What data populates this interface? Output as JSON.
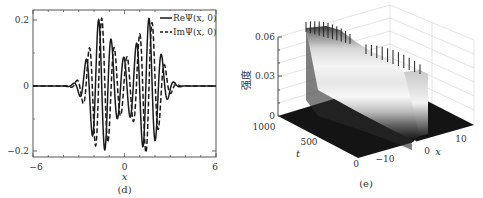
{
  "chart_data": [
    {
      "id": "d",
      "type": "line",
      "caption": "(d)",
      "xlabel": "x",
      "ylabel": "",
      "xlim": [
        -6,
        6
      ],
      "ylim": [
        -0.22,
        0.235
      ],
      "xticks": [
        "-6",
        "0",
        "6"
      ],
      "xtick_values": [
        -6,
        0,
        6
      ],
      "yticks": [
        "0.2",
        "0",
        "-0.2"
      ],
      "ytick_values": [
        0.2,
        0,
        -0.2
      ],
      "grid": false,
      "legend_position": "upper right",
      "series": [
        {
          "name": "ReΨ(x, 0)",
          "style": "solid",
          "color": "#1a1a1a",
          "x_peaks": [
            -2.4,
            -1.6,
            -0.8,
            0.0,
            0.8,
            1.6,
            2.4
          ],
          "description": "oscillating wave packet with two-hump envelope, max ~0.22 near x=±1.6, min ~-0.19"
        },
        {
          "name": "ImΨ(x, 0)",
          "style": "dashed",
          "color": "#1a1a1a",
          "description": "quadrature of Re component, max ~0.23 near x=±1.5, min ~-0.22"
        }
      ],
      "model": {
        "carrier_k": 7.6,
        "envelope": [
          {
            "center": -1.55,
            "width": 1.0,
            "amp": 0.205
          },
          {
            "center": 1.55,
            "width": 1.0,
            "amp": 0.205
          },
          {
            "center": 0.0,
            "width": 0.7,
            "amp": 0.05
          }
        ],
        "phase": 0.35
      }
    },
    {
      "id": "e",
      "type": "surface",
      "caption": "(e)",
      "xlabel": "x",
      "ylabel": "t",
      "zlabel": "强度",
      "xticks": [
        "-10",
        "0",
        "10"
      ],
      "yticks": [
        "0",
        "500",
        "1000"
      ],
      "zticks": [
        "0",
        "0.03",
        "0.06"
      ],
      "zlim": [
        0,
        0.06
      ],
      "colormap": "grayscale",
      "description": "intensity |Ψ|² over x∈[-15,15], t∈[0,1000]; stable double-hump profile ~0.06 peak persists through t, with fine oscillation ripples on top"
    }
  ]
}
